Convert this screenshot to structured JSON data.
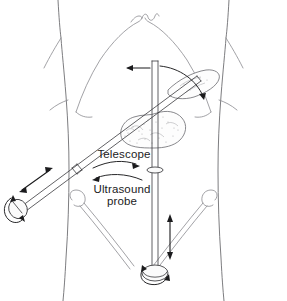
{
  "figure": {
    "background_color": "#ffffff",
    "line_color": "#39393c",
    "outline_color": "#6e6e72",
    "organ_color": "#b4b4b8",
    "width": 287,
    "height": 301
  },
  "labels": {
    "telescope": "Telescope",
    "ultrasound_line1": "Ultrasound",
    "ultrasound_line2": "probe"
  },
  "annotations": {
    "telescope_motion": "curved arrow pointing right",
    "ultrasound_motion": "curved arrow pointing left",
    "shaft_vertical_motion": "double-headed vertical arrow",
    "shaft_lateral_motion": "left-pointing horizontal arrow",
    "telescope_axial_motion": "double-headed diagonal arrow",
    "handle_rotation_left": "rotation arrow at telescope handle",
    "handle_rotation_bottom": "rotation arrow at ultrasound probe handle",
    "tip_sweep": "curved sweep arrow at instrument tip"
  },
  "anatomy": {
    "torso": "abdominal wall outline",
    "costal_margin": "rib cage and xiphoid process",
    "organ": "pancreas",
    "iliac_left": "left inguinal region",
    "iliac_right": "right inguinal region"
  },
  "instruments": {
    "telescope": {
      "name": "laparoscopic telescope",
      "orientation": "diagonal from lower-left to upper-right"
    },
    "ultrasound_probe": {
      "name": "laparoscopic ultrasound probe",
      "orientation": "vertical midline"
    }
  }
}
